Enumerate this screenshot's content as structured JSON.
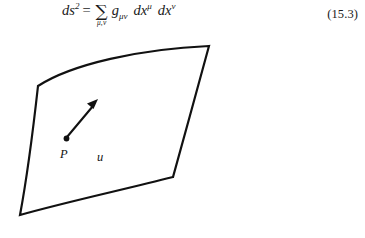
{
  "figure": {
    "background_color": "#ffffff",
    "ink_color": "#111111",
    "equation": {
      "lhs_symbol": "ds",
      "lhs_exponent": "2",
      "relation": "=",
      "sum_symbol": "∑",
      "sum_limits": "μ,ν",
      "metric_symbol": "g",
      "metric_subscript": "μν",
      "differential_symbol": "dx",
      "differential_exponent_1": "μ",
      "differential_exponent_2": "ν",
      "plain_text": "ds² = ∑(μ,ν) gμν dx^μ dx^ν",
      "number": "(15.3)"
    },
    "diagram": {
      "name": "curved-surface-patch",
      "description": "curved two-dimensional manifold patch with a marked point and a tangent vector",
      "point_label": "P",
      "vector_label": "u",
      "stroke_width": 2.2
    }
  }
}
